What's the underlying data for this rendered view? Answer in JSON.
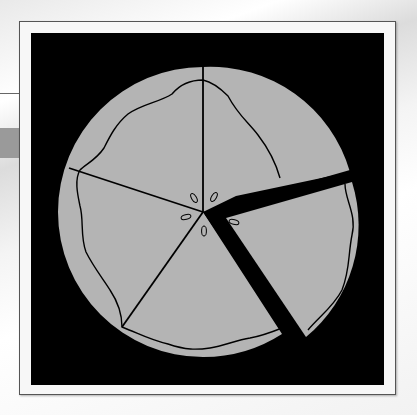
{
  "illustration": {
    "subject": "pie with one slice separated",
    "slices_total": 5,
    "slices_removed": 1,
    "colors": {
      "background_panel": "#000000",
      "frame": "#f7f7f7",
      "pie_fill": "#b4b4b4",
      "lines": "#000000"
    },
    "icons": [
      "pie-icon",
      "slice-icon",
      "vent-holes-icon"
    ]
  }
}
